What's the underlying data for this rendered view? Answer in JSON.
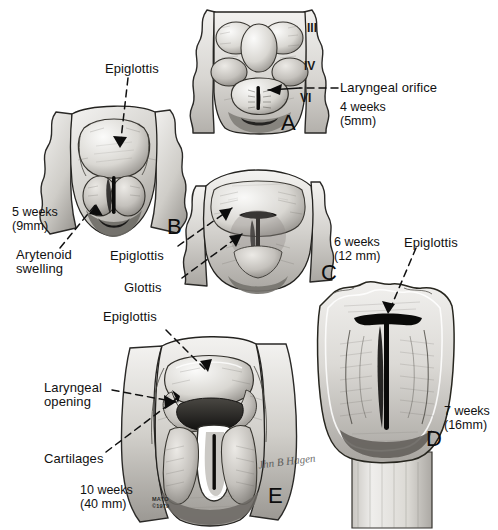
{
  "figure": {
    "background_color": "#ffffff",
    "ink_color": "#111111"
  },
  "credit": {
    "institution": "MAYO",
    "copyright": "©1979",
    "signature": "illustrator-signature"
  },
  "panels": [
    {
      "id": "A",
      "letter": "A",
      "stage_weeks": "4 weeks",
      "stage_size": "(5mm)",
      "caption": "4 weeks\n(5mm)",
      "labels": [
        {
          "text": "Laryngeal orifice",
          "name": "label-laryngeal-orifice"
        }
      ],
      "arch_numerals": [
        "III",
        "IV",
        "VI"
      ]
    },
    {
      "id": "B",
      "letter": "B",
      "stage_weeks": "5 weeks",
      "stage_size": "(9mm)",
      "caption": "5 weeks\n(9mm)",
      "labels": [
        {
          "text": "Epiglottis",
          "name": "label-epiglottis-b"
        },
        {
          "text": "Arytenoid\nswelling",
          "name": "label-arytenoid-swelling"
        }
      ]
    },
    {
      "id": "C",
      "letter": "C",
      "stage_weeks": "6 weeks",
      "stage_size": "(12 mm)",
      "caption": "6 weeks\n(12 mm)",
      "labels": [
        {
          "text": "Epiglottis",
          "name": "label-epiglottis-c"
        },
        {
          "text": "Glottis",
          "name": "label-glottis"
        }
      ]
    },
    {
      "id": "D",
      "letter": "D",
      "stage_weeks": "7 weeks",
      "stage_size": "(16mm)",
      "caption": "7 weeks\n(16mm)",
      "labels": [
        {
          "text": "Epiglottis",
          "name": "label-epiglottis-d"
        }
      ]
    },
    {
      "id": "E",
      "letter": "E",
      "stage_weeks": "10 weeks",
      "stage_size": "(40 mm)",
      "caption": "10 weeks\n(40 mm)",
      "labels": [
        {
          "text": "Epiglottis",
          "name": "label-epiglottis-e"
        },
        {
          "text": "Laryngeal\nopening",
          "name": "label-laryngeal-opening"
        },
        {
          "text": "Cartilages",
          "name": "label-cartilages"
        }
      ]
    }
  ],
  "text": {
    "laryngeal_orifice": "Laryngeal orifice",
    "epiglottis": "Epiglottis",
    "arytenoid_swelling": "Arytenoid\nswelling",
    "glottis": "Glottis",
    "laryngeal_opening": "Laryngeal\nopening",
    "cartilages": "Cartilages",
    "stage_a": "4 weeks\n(5mm)",
    "stage_b": "5 weeks\n(9mm)",
    "stage_c": "6 weeks\n(12 mm)",
    "stage_d": "7 weeks\n(16mm)",
    "stage_e": "10 weeks\n(40 mm)",
    "letter_a": "A",
    "letter_b": "B",
    "letter_c": "C",
    "letter_d": "D",
    "letter_e": "E",
    "arch_iii": "III",
    "arch_iv": "IV",
    "arch_vi": "VI",
    "mayo": "MAYO",
    "copyright_1979": "©1979",
    "signature_text": "Jhn B Hagen"
  }
}
